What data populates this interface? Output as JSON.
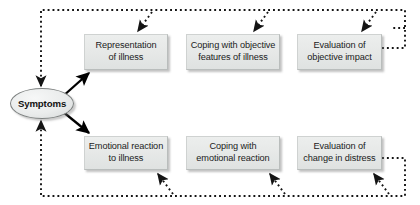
{
  "diagram": {
    "background_color": "#ffffff",
    "box_fill_color": "#e7e9e8",
    "box_border_color": "#b9bdbc",
    "solid_arrow_color": "#000000",
    "dotted_arrow_color": "#1a1a1a",
    "nodes": [
      {
        "id": "symptoms",
        "shape": "ellipse",
        "label": "Symptoms",
        "x": 10,
        "y": 88,
        "w": 64,
        "h": 31
      },
      {
        "id": "representation-of-illness",
        "shape": "rect",
        "label_line1": "Representation",
        "label_line2": "of illness",
        "x": 84,
        "y": 34,
        "w": 84,
        "h": 36
      },
      {
        "id": "coping-objective-features",
        "shape": "rect",
        "label_line1": "Coping with objective",
        "label_line2": "features of illness",
        "x": 186,
        "y": 34,
        "w": 94,
        "h": 36
      },
      {
        "id": "evaluation-objective-impact",
        "shape": "rect",
        "label_line1": "Evaluation of",
        "label_line2": "objective impact",
        "x": 297,
        "y": 34,
        "w": 85,
        "h": 36
      },
      {
        "id": "emotional-reaction-to-illness",
        "shape": "rect",
        "label_line1": "Emotional reaction",
        "label_line2": "to illness",
        "x": 84,
        "y": 136,
        "w": 84,
        "h": 34
      },
      {
        "id": "coping-emotional-reaction",
        "shape": "rect",
        "label_line1": "Coping with",
        "label_line2": "emotional reaction",
        "x": 186,
        "y": 136,
        "w": 94,
        "h": 34
      },
      {
        "id": "evaluation-change-distress",
        "shape": "rect",
        "label_line1": "Evaluation of",
        "label_line2": "change in distress",
        "x": 297,
        "y": 136,
        "w": 85,
        "h": 34
      }
    ],
    "edges": [
      {
        "id": "symptoms-to-representation",
        "style": "solid",
        "from": "symptoms",
        "to": "representation-of-illness"
      },
      {
        "id": "symptoms-to-emotional-reaction",
        "style": "solid",
        "from": "symptoms",
        "to": "emotional-reaction-to-illness"
      },
      {
        "id": "feedback-top-to-symptoms",
        "style": "dotted",
        "from": "top-feedback-bus",
        "to": "symptoms"
      },
      {
        "id": "feedback-top-to-representation",
        "style": "dotted",
        "from": "top-feedback-bus",
        "to": "representation-of-illness"
      },
      {
        "id": "feedback-top-to-coping-objective",
        "style": "dotted",
        "from": "top-feedback-bus",
        "to": "coping-objective-features"
      },
      {
        "id": "feedback-top-to-evaluation-objective",
        "style": "dotted",
        "from": "top-feedback-bus",
        "to": "evaluation-objective-impact"
      },
      {
        "id": "evaluation-objective-to-top-bus",
        "style": "dotted",
        "from": "evaluation-objective-impact",
        "to": "top-feedback-bus"
      },
      {
        "id": "feedback-bottom-to-symptoms",
        "style": "dotted",
        "from": "bottom-feedback-bus",
        "to": "symptoms"
      },
      {
        "id": "feedback-bottom-to-emotional-reaction",
        "style": "dotted",
        "from": "bottom-feedback-bus",
        "to": "emotional-reaction-to-illness"
      },
      {
        "id": "feedback-bottom-to-coping-emotional",
        "style": "dotted",
        "from": "bottom-feedback-bus",
        "to": "coping-emotional-reaction"
      },
      {
        "id": "feedback-bottom-to-evaluation-change",
        "style": "dotted",
        "from": "bottom-feedback-bus",
        "to": "evaluation-change-distress"
      },
      {
        "id": "evaluation-change-to-bottom-bus",
        "style": "dotted",
        "from": "evaluation-change-distress",
        "to": "bottom-feedback-bus"
      }
    ]
  }
}
